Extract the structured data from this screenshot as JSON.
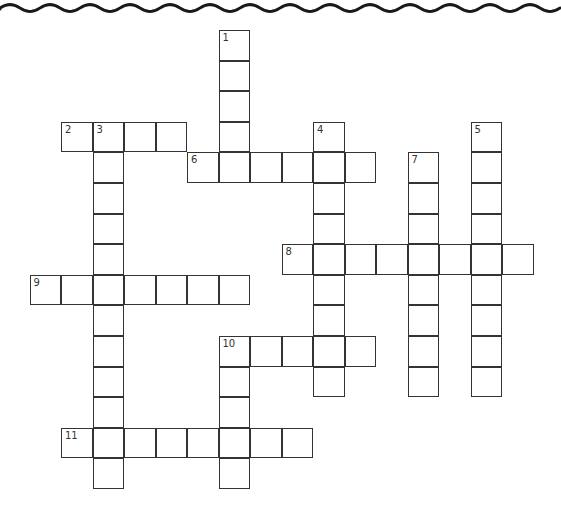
{
  "puzzle": {
    "type": "crossword",
    "grid_origin": {
      "x": 29.5,
      "y": 30
    },
    "cell_pitch": {
      "x": 31.5,
      "y": 30.6
    },
    "clues": [
      {
        "number": "1",
        "direction": "down",
        "col": 6,
        "row": 0,
        "length": 5
      },
      {
        "number": "2",
        "direction": "across",
        "col": 1,
        "row": 3,
        "length": 4
      },
      {
        "number": "3",
        "direction": "down",
        "col": 2,
        "row": 3,
        "length": 12
      },
      {
        "number": "4",
        "direction": "down",
        "col": 9,
        "row": 3,
        "length": 9
      },
      {
        "number": "5",
        "direction": "down",
        "col": 14,
        "row": 3,
        "length": 9
      },
      {
        "number": "6",
        "direction": "across",
        "col": 5,
        "row": 4,
        "length": 6
      },
      {
        "number": "7",
        "direction": "down",
        "col": 12,
        "row": 4,
        "length": 8
      },
      {
        "number": "8",
        "direction": "across",
        "col": 8,
        "row": 7,
        "length": 8
      },
      {
        "number": "9",
        "direction": "across",
        "col": 0,
        "row": 8,
        "length": 7
      },
      {
        "number": "10",
        "direction": "across",
        "col": 6,
        "row": 10,
        "length": 5
      },
      {
        "number": "10",
        "direction": "down",
        "col": 6,
        "row": 10,
        "length": 5
      },
      {
        "number": "11",
        "direction": "across",
        "col": 1,
        "row": 13,
        "length": 8
      }
    ]
  },
  "decoration": {
    "top_border": "wavy-line",
    "color": "#1a1a1a"
  }
}
